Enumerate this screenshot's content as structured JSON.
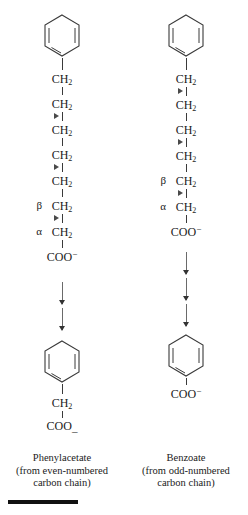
{
  "diagram": {
    "colors": {
      "bond": "#3a3a3a",
      "marker": "#4a4a4a",
      "arrow": "#6a6a6a",
      "text": "#1a1a1a",
      "rule": "#111111"
    }
  },
  "labels": {
    "ch2": "CH",
    "ch2_sub": "2",
    "coo": "COO",
    "coo_sup": "−",
    "coo_plain_minus": "_",
    "alpha": "α",
    "beta": "β"
  },
  "left": {
    "id": "phenylacetate-pathway",
    "units": [
      {
        "label": "CH",
        "sub": "2",
        "greek": "",
        "marker_below": false
      },
      {
        "label": "CH",
        "sub": "2",
        "greek": "",
        "marker_below": true
      },
      {
        "label": "CH",
        "sub": "2",
        "greek": "",
        "marker_below": false
      },
      {
        "label": "CH",
        "sub": "2",
        "greek": "",
        "marker_below": true
      },
      {
        "label": "CH",
        "sub": "2",
        "greek": "",
        "marker_below": false
      },
      {
        "label": "CH",
        "sub": "2",
        "greek": "β",
        "marker_below": true
      },
      {
        "label": "CH",
        "sub": "2",
        "greek": "α",
        "marker_below": false
      },
      {
        "label": "COO",
        "sup": "−",
        "greek": "",
        "marker_below": false
      }
    ],
    "arrow_count": 2,
    "product": {
      "terminal": "CH",
      "terminal_sub": "2",
      "acid": "COO",
      "acid_sup": "_"
    },
    "caption": {
      "name": "Phenylacetate",
      "line1": "(from even-numbered",
      "line2": "carbon chain)"
    }
  },
  "right": {
    "id": "benzoate-pathway",
    "units": [
      {
        "label": "CH",
        "sub": "2",
        "greek": "",
        "marker_below": true
      },
      {
        "label": "CH",
        "sub": "2",
        "greek": "",
        "marker_below": false
      },
      {
        "label": "CH",
        "sub": "2",
        "greek": "",
        "marker_below": true
      },
      {
        "label": "CH",
        "sub": "2",
        "greek": "",
        "marker_below": false
      },
      {
        "label": "CH",
        "sub": "2",
        "greek": "β",
        "marker_below": true
      },
      {
        "label": "CH",
        "sub": "2",
        "greek": "α",
        "marker_below": false
      },
      {
        "label": "COO",
        "sup": "−",
        "greek": "",
        "marker_below": false
      }
    ],
    "arrow_count": 3,
    "product": {
      "acid": "COO",
      "acid_sup": "−"
    },
    "caption": {
      "name": "Benzoate",
      "line1": "(from odd-numbered",
      "line2": "carbon chain)"
    }
  }
}
